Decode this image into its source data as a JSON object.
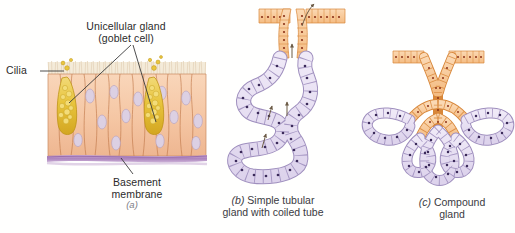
{
  "figure": {
    "background_color": "#fffffe"
  },
  "palette": {
    "columnar_cell_fill": "#f6caa9",
    "columnar_cell_fill_dark": "#eeb892",
    "columnar_outline": "#c07a4e",
    "nucleus_fill": "#ddd0e2",
    "nucleus_outline": "#b9a6c4",
    "goblet_fill": "#e9c63f",
    "goblet_outline": "#c39a1c",
    "goblet_granule": "#f0d566",
    "cilia_color": "#efe2cc",
    "basement_membrane": "#b48cc0",
    "duct_fill": "#f7c79c",
    "duct_outline": "#d98a3c",
    "duct_nucleus": "#8c3218",
    "secretory_fill": "#e6dff0",
    "secretory_outline": "#9f8fbe",
    "secretory_nucleus": "#3b2a5a",
    "leader_line": "#3a3a3a",
    "arrow_color": "#5a4a3a"
  },
  "panels": [
    {
      "id": "a",
      "sub_label": "(a)",
      "kind": "surface epithelium with unicellular glands",
      "callouts": [
        {
          "name": "unicellular-gland",
          "line1": "Unicellular gland",
          "line2": "(goblet cell)"
        },
        {
          "name": "cilia",
          "text": "Cilia"
        },
        {
          "name": "basement-membrane",
          "line1": "Basement",
          "line2": "membrane"
        }
      ]
    },
    {
      "id": "b",
      "prefix": "(b)",
      "caption_line1": "Simple tubular",
      "caption_line2": "gland with coiled tube",
      "kind": "simple coiled tubular gland"
    },
    {
      "id": "c",
      "prefix": "(c)",
      "caption_line1": "Compound",
      "caption_line2": "gland",
      "kind": "compound branched gland"
    }
  ]
}
